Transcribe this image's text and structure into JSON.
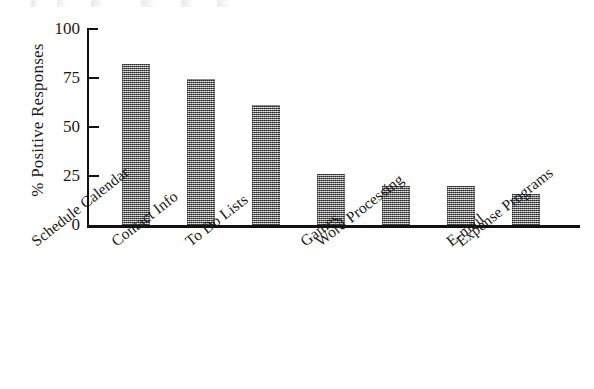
{
  "chart_data": {
    "type": "bar",
    "title": "",
    "subtitle": "",
    "xlabel": "",
    "ylabel": "% Positive Responses",
    "ylim": [
      0,
      100
    ],
    "yticks": [
      0,
      25,
      50,
      75,
      100
    ],
    "ytick_labels": [
      "0",
      "25",
      "50",
      "75",
      "100"
    ],
    "grid": false,
    "legend": false,
    "legend_position": "none",
    "orientation": "vertical",
    "bar_color": "#8c8c8c",
    "axis_color": "#111111",
    "background_color": "#ffffff",
    "categories": [
      "Schedule Calendar",
      "Contact Info",
      "To Do Lists",
      "Games",
      "Word Processing",
      "E-mail",
      "Expense Programs"
    ],
    "values": [
      82,
      74,
      61,
      26,
      20,
      20,
      16
    ],
    "annotations": []
  },
  "axes": {
    "y_title": "% Positive Responses",
    "y_tick_0": "0",
    "y_tick_25": "25",
    "y_tick_50": "50",
    "y_tick_75": "75",
    "y_tick_100": "100"
  },
  "x_labels": {
    "b0": "Schedule Calendar",
    "b1": "Contact Info",
    "b2": "To Do Lists",
    "b3": "Games",
    "b4": "Word Processing",
    "b5": "E-mail",
    "b6": "Expense Programs"
  }
}
